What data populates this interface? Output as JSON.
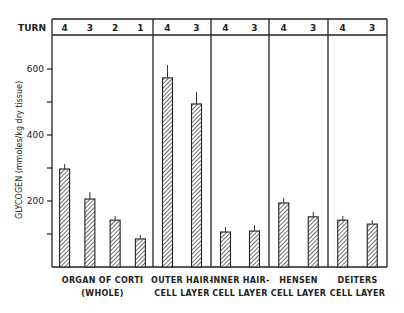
{
  "chart_data": {
    "type": "bar",
    "title": "",
    "xlabel": "",
    "ylabel": "GLYCOGEN (mmoles/kg dry tissue)",
    "ylim": [
      0,
      700
    ],
    "yticks": [
      200,
      400,
      600
    ],
    "header_label": "TURN",
    "grid": false,
    "legend": null,
    "groups": [
      {
        "label_lines": [
          "ORGAN OF CORTI",
          "(WHOLE)"
        ],
        "turns": [
          "4",
          "3",
          "2",
          "1"
        ],
        "values": [
          297,
          206,
          142,
          85
        ],
        "errors": [
          15,
          21,
          13,
          12
        ]
      },
      {
        "label_lines": [
          "OUTER HAIR-",
          "CELL LAYER"
        ],
        "turns": [
          "4",
          "3"
        ],
        "values": [
          573,
          494
        ],
        "errors": [
          39,
          36
        ]
      },
      {
        "label_lines": [
          "INNER HAIR-",
          "CELL LAYER"
        ],
        "turns": [
          "4",
          "3"
        ],
        "values": [
          106,
          109
        ],
        "errors": [
          15,
          18
        ]
      },
      {
        "label_lines": [
          "HENSEN",
          "CELL LAYER"
        ],
        "turns": [
          "4",
          "3"
        ],
        "values": [
          194,
          152
        ],
        "errors": [
          15,
          15
        ]
      },
      {
        "label_lines": [
          "DEITERS",
          "CELL LAYER"
        ],
        "turns": [
          "4",
          "3"
        ],
        "values": [
          142,
          130
        ],
        "errors": [
          13,
          12
        ]
      }
    ]
  }
}
